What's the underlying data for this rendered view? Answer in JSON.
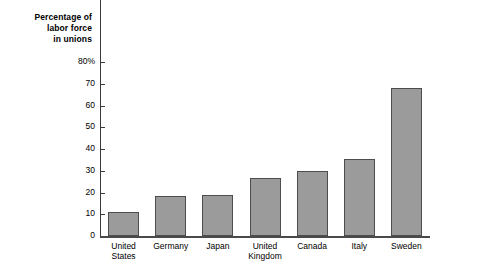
{
  "chart_data": {
    "type": "bar",
    "title": "Percentage of labor force in unions",
    "title_lines": [
      "Percentage of",
      "labor force",
      "in unions"
    ],
    "xlabel": "",
    "ylabel": "Percentage of labor force in unions",
    "ylim": [
      0,
      80
    ],
    "ytick_values": [
      0,
      10,
      20,
      30,
      40,
      50,
      60,
      70,
      80
    ],
    "ytick_labels": [
      "0",
      "10",
      "20",
      "30",
      "40",
      "50",
      "60",
      "70",
      "80%"
    ],
    "grid": false,
    "legend": null,
    "categories": [
      "United States",
      "Germany",
      "Japan",
      "United Kingdom",
      "Canada",
      "Italy",
      "Sweden"
    ],
    "category_label_lines": [
      [
        "United",
        "States"
      ],
      [
        "Germany"
      ],
      [
        "Japan"
      ],
      [
        "United",
        "Kingdom"
      ],
      [
        "Canada"
      ],
      [
        "Italy"
      ],
      [
        "Sweden"
      ]
    ],
    "values": [
      11,
      18.5,
      19,
      26.5,
      30,
      35.5,
      68
    ],
    "bar_fill_color": "#9b9b9b",
    "bar_border_color": "#4d4d4d",
    "axis_color": "#3a3a3a",
    "background_color": "#ffffff"
  }
}
